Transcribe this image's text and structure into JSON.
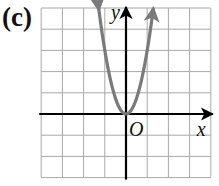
{
  "panel_label": "(c)",
  "chart_data": {
    "type": "line",
    "title": "",
    "xlabel": "x",
    "ylabel": "y",
    "origin_label": "O",
    "xlim": [
      -4,
      4
    ],
    "ylim": [
      -3,
      5
    ],
    "grid": true,
    "grid_step": 1,
    "tick_labels": false,
    "series": [
      {
        "name": "parabola",
        "equation": "y = 3x^2",
        "vertex": [
          0,
          0
        ],
        "color": "#7a7a7a",
        "arrows_at_ends": true,
        "x": [
          -1.29,
          -1.0,
          -0.5,
          0,
          0.5,
          1.0,
          1.29
        ],
        "y": [
          5,
          3,
          0.75,
          0,
          0.75,
          3,
          5
        ]
      }
    ]
  },
  "colors": {
    "grid": "#a8a8a8",
    "axes": "#000000",
    "curve": "#7a7a7a"
  }
}
